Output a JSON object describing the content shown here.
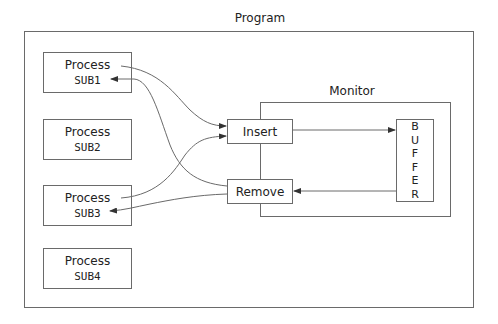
{
  "program": {
    "label": "Program"
  },
  "processes": [
    {
      "label": "Process",
      "name": "SUB1"
    },
    {
      "label": "Process",
      "name": "SUB2"
    },
    {
      "label": "Process",
      "name": "SUB3"
    },
    {
      "label": "Process",
      "name": "SUB4"
    }
  ],
  "monitor": {
    "label": "Monitor",
    "insert_label": "Insert",
    "remove_label": "Remove",
    "buffer_letters": [
      "B",
      "U",
      "F",
      "F",
      "E",
      "R"
    ]
  },
  "colors": {
    "line": "#6a6a6a",
    "arrow": "#333333",
    "text": "#222222"
  }
}
